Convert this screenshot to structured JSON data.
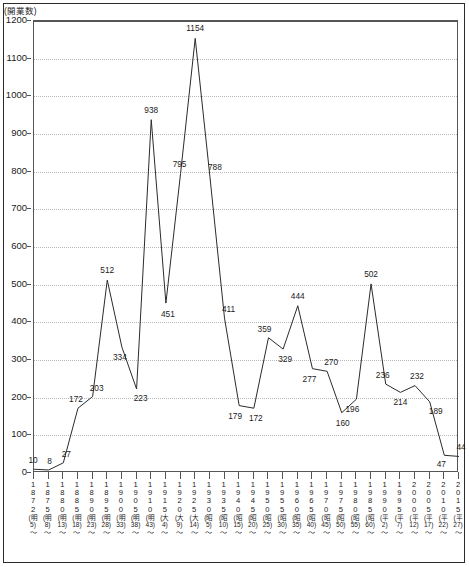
{
  "chart_data": {
    "type": "line",
    "title": "",
    "subtitle": "",
    "ylabel": "(開業数)",
    "xlabel": "",
    "ylim": [
      0,
      1200
    ],
    "ytick_step": 100,
    "grid": true,
    "legend": "none",
    "yticks": [
      "0",
      "100",
      "200",
      "300",
      "400",
      "500",
      "600",
      "700",
      "800",
      "900",
      "1000",
      "1100",
      "1200"
    ],
    "categories": [
      "1872(明5)〜",
      "1875(明8)〜",
      "1880(明13)〜",
      "1885(明18)〜",
      "1890(明23)〜",
      "1895(明28)〜",
      "1900(明33)〜",
      "1905(明38)〜",
      "1910(明43)〜",
      "1915(大4)〜",
      "1920(大9)〜",
      "1925(大14)〜",
      "1930(昭5)〜",
      "1935(昭10)〜",
      "1940(昭15)〜",
      "1945(昭20)〜",
      "1950(昭25)〜",
      "1955(昭30)〜",
      "1960(昭35)〜",
      "1965(昭40)〜",
      "1970(昭45)〜",
      "1975(昭50)〜",
      "1980(昭55)〜",
      "1985(昭60)〜",
      "1990(平2)〜",
      "1995(平7)〜",
      "2000(平12)〜",
      "2005(平17)〜",
      "2010(平22)〜",
      "2015(平27)〜"
    ],
    "category_parts": [
      {
        "year": "1872",
        "era": "明5",
        "tilde": "〜"
      },
      {
        "year": "1875",
        "era": "明8",
        "tilde": "〜"
      },
      {
        "year": "1880",
        "era": "明13",
        "tilde": "〜"
      },
      {
        "year": "1885",
        "era": "明18",
        "tilde": "〜"
      },
      {
        "year": "1890",
        "era": "明23",
        "tilde": "〜"
      },
      {
        "year": "1895",
        "era": "明28",
        "tilde": "〜"
      },
      {
        "year": "1900",
        "era": "明33",
        "tilde": "〜"
      },
      {
        "year": "1905",
        "era": "明38",
        "tilde": "〜"
      },
      {
        "year": "1910",
        "era": "明43",
        "tilde": "〜"
      },
      {
        "year": "1915",
        "era": "大4",
        "tilde": "〜"
      },
      {
        "year": "1920",
        "era": "大9",
        "tilde": "〜"
      },
      {
        "year": "1925",
        "era": "大14",
        "tilde": "〜"
      },
      {
        "year": "1930",
        "era": "昭5",
        "tilde": "〜"
      },
      {
        "year": "1935",
        "era": "昭10",
        "tilde": "〜"
      },
      {
        "year": "1940",
        "era": "昭15",
        "tilde": "〜"
      },
      {
        "year": "1945",
        "era": "昭20",
        "tilde": "〜"
      },
      {
        "year": "1950",
        "era": "昭25",
        "tilde": "〜"
      },
      {
        "year": "1955",
        "era": "昭30",
        "tilde": "〜"
      },
      {
        "year": "1960",
        "era": "昭35",
        "tilde": "〜"
      },
      {
        "year": "1965",
        "era": "昭40",
        "tilde": "〜"
      },
      {
        "year": "1970",
        "era": "昭45",
        "tilde": "〜"
      },
      {
        "year": "1975",
        "era": "昭50",
        "tilde": "〜"
      },
      {
        "year": "1980",
        "era": "昭55",
        "tilde": "〜"
      },
      {
        "year": "1985",
        "era": "昭60",
        "tilde": "〜"
      },
      {
        "year": "1990",
        "era": "平2",
        "tilde": "〜"
      },
      {
        "year": "1995",
        "era": "平7",
        "tilde": "〜"
      },
      {
        "year": "2000",
        "era": "平12",
        "tilde": "〜"
      },
      {
        "year": "2005",
        "era": "平17",
        "tilde": "〜"
      },
      {
        "year": "2010",
        "era": "平22",
        "tilde": "〜"
      },
      {
        "year": "2015",
        "era": "平27",
        "tilde": "〜"
      }
    ],
    "values": [
      10,
      8,
      27,
      172,
      203,
      512,
      334,
      223,
      938,
      451,
      795,
      1154,
      788,
      411,
      179,
      172,
      359,
      329,
      444,
      277,
      270,
      160,
      196,
      502,
      236,
      214,
      232,
      189,
      47,
      44
    ],
    "point_label_offsets": [
      {
        "dx": -1,
        "dy": -9
      },
      {
        "dx": 1,
        "dy": -9
      },
      {
        "dx": 3,
        "dy": -9
      },
      {
        "dx": -2,
        "dy": -9
      },
      {
        "dx": 4,
        "dy": -9
      },
      {
        "dx": 0,
        "dy": -10
      },
      {
        "dx": -2,
        "dy": 10
      },
      {
        "dx": 4,
        "dy": 9
      },
      {
        "dx": 0,
        "dy": -10
      },
      {
        "dx": 2,
        "dy": 11
      },
      {
        "dx": -1,
        "dy": -10
      },
      {
        "dx": 0,
        "dy": -10
      },
      {
        "dx": 5,
        "dy": -9
      },
      {
        "dx": 4,
        "dy": -9
      },
      {
        "dx": -4,
        "dy": 10
      },
      {
        "dx": 2,
        "dy": 10
      },
      {
        "dx": -4,
        "dy": -9
      },
      {
        "dx": 2,
        "dy": 10
      },
      {
        "dx": 0,
        "dy": -10
      },
      {
        "dx": -3,
        "dy": 10
      },
      {
        "dx": 4,
        "dy": -9
      },
      {
        "dx": 1,
        "dy": 10
      },
      {
        "dx": -4,
        "dy": 10
      },
      {
        "dx": 0,
        "dy": -10
      },
      {
        "dx": -3,
        "dy": -9
      },
      {
        "dx": 0,
        "dy": 10
      },
      {
        "dx": 2,
        "dy": -10
      },
      {
        "dx": 6,
        "dy": 9
      },
      {
        "dx": -3,
        "dy": 9
      },
      {
        "dx": 2,
        "dy": -9
      }
    ],
    "series_color": "#2b2b2b",
    "grid_color": "#b9b9b9",
    "axis_color": "#555555"
  }
}
